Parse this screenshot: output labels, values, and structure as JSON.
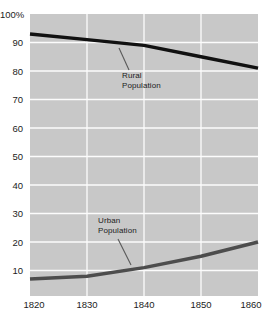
{
  "chart_data": {
    "type": "line",
    "title": "",
    "xlabel": "",
    "ylabel": "",
    "x": [
      1820,
      1830,
      1840,
      1850,
      1860
    ],
    "series": [
      {
        "name": "Rural Population",
        "values": [
          93,
          91,
          89,
          85,
          81
        ],
        "color": "#111111"
      },
      {
        "name": "Urban Population",
        "values": [
          7,
          8,
          11,
          15,
          20
        ],
        "color": "#4d4d4d"
      }
    ],
    "ylim": [
      0,
      100
    ],
    "xlim": [
      1820,
      1860
    ],
    "grid": true,
    "plot_background": "#c8c8c8",
    "gridline_color": "#fcfcfc",
    "y_ticks": [
      {
        "value": 100,
        "label": "100%"
      },
      {
        "value": 90,
        "label": "90"
      },
      {
        "value": 80,
        "label": "80"
      },
      {
        "value": 70,
        "label": "70"
      },
      {
        "value": 60,
        "label": "60"
      },
      {
        "value": 50,
        "label": "50"
      },
      {
        "value": 40,
        "label": "40"
      },
      {
        "value": 30,
        "label": "30"
      },
      {
        "value": 20,
        "label": "20"
      },
      {
        "value": 10,
        "label": "10"
      }
    ],
    "x_ticks": [
      {
        "value": 1820,
        "label": "1820"
      },
      {
        "value": 1830,
        "label": "1830"
      },
      {
        "value": 1840,
        "label": "1840"
      },
      {
        "value": 1850,
        "label": "1850"
      },
      {
        "value": 1860,
        "label": "1860"
      }
    ],
    "annotations": [
      {
        "target": "Rural Population",
        "line1": "Rural",
        "line2": "Population"
      },
      {
        "target": "Urban Population",
        "line1": "Urban",
        "line2": "Population"
      }
    ]
  }
}
